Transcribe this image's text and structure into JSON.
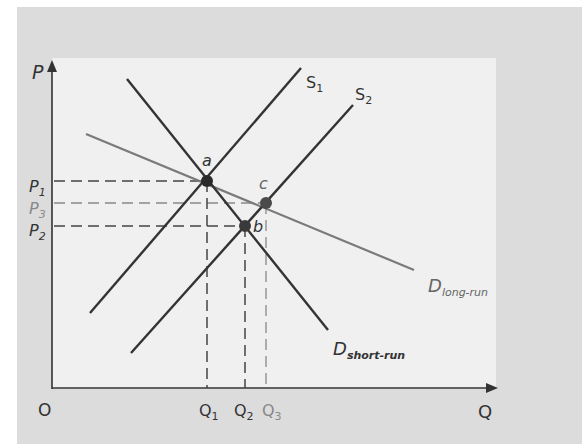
{
  "diagram": {
    "axes": {
      "y_label": "P",
      "x_label": "Q",
      "origin_label": "O"
    },
    "colors": {
      "outer_bg": "#dcdcdc",
      "inner_bg": "#f0f0f0",
      "dark_line": "#333333",
      "gray_line": "#7a7a7a",
      "point": "#2a2a2a"
    },
    "curves": {
      "s1": {
        "label": "S",
        "sub": "1"
      },
      "s2": {
        "label": "S",
        "sub": "2"
      },
      "d_short": {
        "label": "D",
        "sub": "short-run"
      },
      "d_long": {
        "label": "D",
        "sub": "long-run"
      }
    },
    "points": {
      "a": "a",
      "b": "b",
      "c": "c"
    },
    "price_ticks": [
      {
        "label": "P",
        "sub": "1"
      },
      {
        "label": "P",
        "sub": "3"
      },
      {
        "label": "P",
        "sub": "2"
      }
    ],
    "quantity_ticks": [
      {
        "label": "Q",
        "sub": "1"
      },
      {
        "label": "Q",
        "sub": "2"
      },
      {
        "label": "Q",
        "sub": "3"
      }
    ]
  }
}
